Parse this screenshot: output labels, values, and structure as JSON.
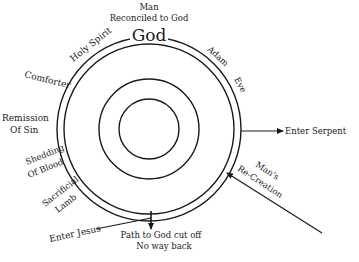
{
  "diagram": {
    "title_top": {
      "line1": "Man",
      "line2": "Reconciled to God"
    },
    "center_label": "God",
    "rings": {
      "center": [
        149,
        129
      ],
      "radii": [
        30,
        50,
        85,
        92
      ],
      "stroke_color": "#1a1a1a"
    },
    "arc_labels_left": {
      "holy_spirit": "Holy Spirit",
      "comforter": "Comforter",
      "remission_1": "Remission",
      "remission_2": "Of Sin",
      "shedding_1": "Shedding",
      "shedding_2": "Of Blood",
      "lamb_1": "Sacrificial",
      "lamb_2": "Lamb"
    },
    "arc_labels_right": {
      "adam": "Adam",
      "eve": "Eve"
    },
    "arrows": {
      "serpent": "Enter Serpent",
      "recreation_1": "Man's",
      "recreation_2": "Re-Creation",
      "jesus": "Enter Jesus"
    },
    "bottom_note": {
      "line1": "Path to God cut off",
      "line2": "No way back"
    }
  }
}
